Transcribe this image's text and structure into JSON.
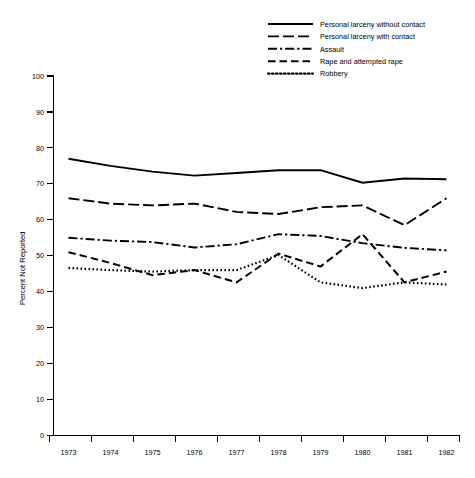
{
  "chart_data": {
    "type": "line",
    "title": "",
    "xlabel": "",
    "ylabel": "Percent Not Reported",
    "x": [
      1973,
      1974,
      1975,
      1976,
      1977,
      1978,
      1979,
      1980,
      1981,
      1982
    ],
    "xtick_labels": [
      "1973",
      "1974",
      "1975",
      "1976",
      "1977",
      "1978",
      "1979",
      "1980",
      "1981",
      "1982"
    ],
    "ytick_labels": [
      "0",
      "10",
      "20",
      "30",
      "40",
      "50",
      "60",
      "70",
      "80",
      "90",
      "100"
    ],
    "ytick_values": [
      0,
      10,
      20,
      30,
      40,
      50,
      60,
      70,
      80,
      90,
      100
    ],
    "ylim": [
      0,
      100
    ],
    "xlim": [
      1973,
      1982
    ],
    "grid": false,
    "legend_position": "top-right",
    "series": [
      {
        "name": "Personal larceny without contact",
        "style": "solid",
        "dasharray": "",
        "width": 1.9,
        "values": [
          77.0,
          75.0,
          73.4,
          72.3,
          73.0,
          73.8,
          73.8,
          70.3,
          71.5,
          71.3
        ]
      },
      {
        "name": "Personal larceny with contact",
        "style": "long-dash",
        "dasharray": "11,4",
        "width": 1.9,
        "values": [
          66.0,
          64.5,
          64.0,
          64.5,
          62.2,
          61.6,
          63.5,
          64.0,
          58.5,
          66.0
        ]
      },
      {
        "name": "Assault",
        "style": "dash-dot",
        "dasharray": "9,3,2.2,3",
        "width": 1.9,
        "values": [
          55.0,
          54.2,
          53.8,
          52.3,
          53.2,
          56.0,
          55.5,
          53.5,
          52.2,
          51.5
        ]
      },
      {
        "name": "Rape and attempted rape",
        "style": "dashed",
        "dasharray": "7.5,4",
        "width": 2.0,
        "values": [
          51.0,
          48.0,
          44.6,
          46.0,
          42.6,
          50.6,
          47.0,
          56.0,
          42.6,
          45.6
        ]
      },
      {
        "name": "Robbery",
        "style": "dotted",
        "dasharray": "1.6,2.4",
        "width": 2.2,
        "values": [
          46.6,
          46.0,
          45.6,
          46.0,
          46.0,
          50.2,
          42.6,
          41.0,
          42.6,
          42.0
        ]
      }
    ]
  },
  "legend": {
    "items": [
      {
        "label": "Personal larceny without contact"
      },
      {
        "label": "Personal larceny with contact"
      },
      {
        "label": "Assault"
      },
      {
        "label": "Rape and attempted rape"
      },
      {
        "label": "Robbery"
      }
    ]
  },
  "axes": {
    "y_title": "Percent Not Reported"
  },
  "colors": {
    "ink": "#000000",
    "background": "#ffffff"
  }
}
